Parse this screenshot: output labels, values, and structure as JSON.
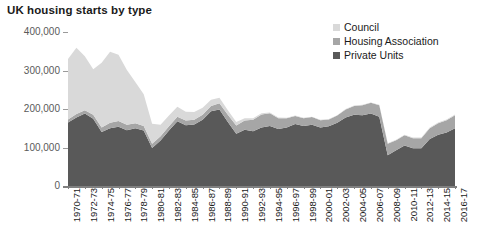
{
  "chart_data": {
    "type": "area",
    "stacked": true,
    "title": "UK housing starts by type",
    "xlabel": "",
    "ylabel": "",
    "ylim": [
      0,
      400000
    ],
    "yticks": [
      0,
      100000,
      200000,
      300000,
      400000
    ],
    "ytick_labels": [
      "0",
      "100,000",
      "200,000",
      "300,000",
      "400,000"
    ],
    "grid": false,
    "legend_position": "top-right",
    "x": [
      "1970-71",
      "1971-72",
      "1972-73",
      "1973-74",
      "1974-75",
      "1975-76",
      "1976-77",
      "1977-78",
      "1978-79",
      "1979-80",
      "1980-81",
      "1981-82",
      "1982-83",
      "1983-84",
      "1984-85",
      "1985-86",
      "1986-87",
      "1987-88",
      "1988-89",
      "1989-90",
      "1990-91",
      "1991-92",
      "1992-93",
      "1993-94",
      "1994-95",
      "1995-96",
      "1996-97",
      "1997-98",
      "1998-99",
      "1999-00",
      "2000-01",
      "2001-02",
      "2002-03",
      "2003-04",
      "2004-05",
      "2005-06",
      "2006-07",
      "2007-08",
      "2008-09",
      "2009-10",
      "2010-11",
      "2011-12",
      "2012-13",
      "2013-14",
      "2014-15",
      "2015-16",
      "2016-17"
    ],
    "xtick_labels": [
      "1970-71",
      "1972-73",
      "1974-75",
      "1976-77",
      "1978-79",
      "1980-81",
      "1982-83",
      "1984-85",
      "1986-87",
      "1988-89",
      "1990-91",
      "1992-93",
      "1994-95",
      "1996-97",
      "1998-99",
      "2000-01",
      "2002-03",
      "2004-05",
      "2006-07",
      "2008-09",
      "2010-11",
      "2012-13",
      "2014-15",
      "2016-17"
    ],
    "xtick_every": 2,
    "series": [
      {
        "name": "Private Units",
        "color": "#595959",
        "values": [
          165000,
          178000,
          188000,
          175000,
          140000,
          150000,
          154000,
          145000,
          150000,
          144000,
          99000,
          118000,
          144000,
          168000,
          158000,
          160000,
          172000,
          194000,
          199000,
          166000,
          136000,
          146000,
          142000,
          152000,
          156000,
          148000,
          152000,
          161000,
          156000,
          159000,
          152000,
          155000,
          164000,
          178000,
          185000,
          184000,
          188000,
          180000,
          80000,
          93000,
          105000,
          98000,
          98000,
          122000,
          133000,
          139000,
          150000
        ]
      },
      {
        "name": "Housing Association",
        "color": "#a6a6a6",
        "values": [
          8000,
          9000,
          9000,
          10000,
          12000,
          14000,
          15000,
          14000,
          13000,
          12000,
          11000,
          11000,
          11000,
          12000,
          12000,
          12000,
          13000,
          14000,
          16000,
          19000,
          21000,
          24000,
          30000,
          34000,
          33000,
          28000,
          24000,
          21000,
          20000,
          20000,
          19000,
          18000,
          19000,
          21000,
          23000,
          26000,
          28000,
          30000,
          30000,
          26000,
          27000,
          26000,
          26000,
          28000,
          30000,
          32000,
          34000
        ]
      },
      {
        "name": "Council",
        "color": "#d9d9d9",
        "values": [
          157000,
          172000,
          140000,
          118000,
          168000,
          185000,
          172000,
          142000,
          107000,
          82000,
          52000,
          30000,
          28000,
          26000,
          23000,
          20000,
          18000,
          16000,
          14000,
          12000,
          9000,
          6000,
          4000,
          3000,
          2000,
          2000,
          1000,
          1000,
          1000,
          1000,
          1000,
          1000,
          1000,
          1000,
          1000,
          1000,
          1000,
          1000,
          1000,
          1000,
          1000,
          2000,
          2000,
          2000,
          2000,
          2000,
          2000
        ]
      }
    ],
    "legend": [
      {
        "label": "Council",
        "color": "#d9d9d9"
      },
      {
        "label": "Housing Association",
        "color": "#a6a6a6"
      },
      {
        "label": "Private Units",
        "color": "#595959"
      }
    ]
  },
  "source_note": ""
}
